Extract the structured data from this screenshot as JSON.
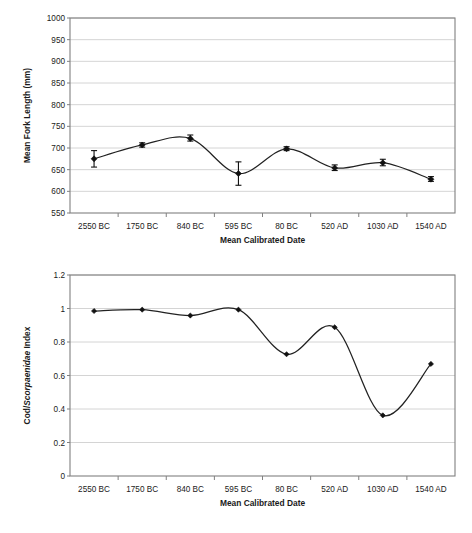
{
  "chart_data": [
    {
      "id": "fork-length",
      "type": "line",
      "title": "",
      "xlabel": "Mean Calibrated Date",
      "ylabel": "Mean Fork Length (mm)",
      "categories": [
        "2550 BC",
        "1750 BC",
        "840 BC",
        "595 BC",
        "80 BC",
        "520 AD",
        "1030 AD",
        "1540 AD"
      ],
      "values": [
        675,
        707,
        722,
        641,
        698,
        654,
        666,
        628
      ],
      "error_low": [
        656,
        702,
        716,
        614,
        694,
        648,
        659,
        623
      ],
      "error_high": [
        694,
        712,
        730,
        668,
        703,
        661,
        674,
        634
      ],
      "ylim": [
        550,
        1000
      ],
      "yticks": [
        "550",
        "600",
        "650",
        "700",
        "750",
        "800",
        "850",
        "900",
        "950",
        "1000"
      ],
      "ytick_values": [
        550,
        600,
        650,
        700,
        750,
        800,
        850,
        900,
        950,
        1000
      ],
      "grid": true,
      "legend": "none",
      "marker": "diamond",
      "smoothing": true
    },
    {
      "id": "cod-scorpaenidae-index",
      "type": "line",
      "title": "",
      "xlabel": "Mean Calibrated Date",
      "ylabel_prefix": "Cod/",
      "ylabel_italic": "Scorpaenidae",
      "ylabel_suffix": " Index",
      "ylabel": "Cod/Scorpaenidae Index",
      "categories": [
        "2550 BC",
        "1750 BC",
        "840 BC",
        "595 BC",
        "80 BC",
        "520 AD",
        "1030 AD",
        "1540 AD"
      ],
      "values": [
        0.985,
        0.993,
        0.958,
        0.993,
        0.727,
        0.888,
        0.362,
        0.669
      ],
      "ylim": [
        0,
        1.2
      ],
      "yticks": [
        "0",
        "0.2",
        "0.4",
        "0.6",
        "0.8",
        "1",
        "1.2"
      ],
      "ytick_values": [
        0,
        0.2,
        0.4,
        0.6,
        0.8,
        1,
        1.2
      ],
      "grid": true,
      "legend": "none",
      "marker": "diamond",
      "smoothing": true
    }
  ],
  "colors": {
    "line": "#222222",
    "marker": "#111111",
    "grid": "#c9c9c9",
    "frame": "#808080",
    "text": "#1a1a1a",
    "background": "#ffffff"
  }
}
